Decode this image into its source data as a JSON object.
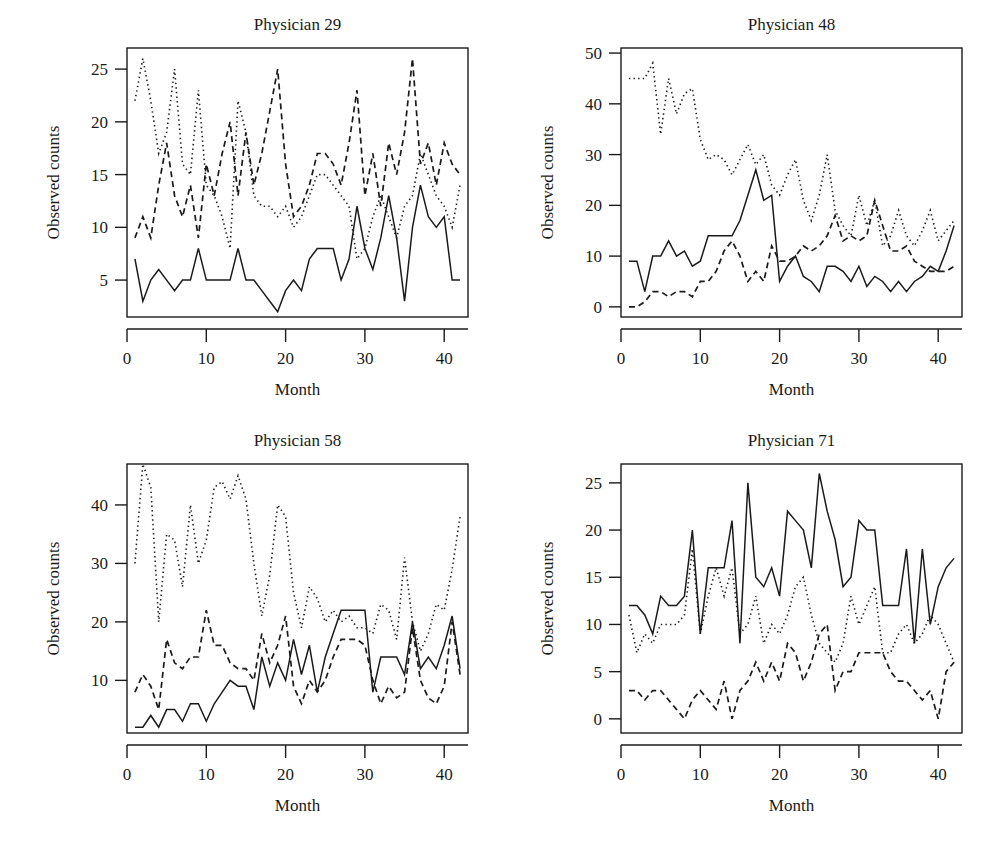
{
  "figure": {
    "background_color": "#ffffff",
    "line_color": "#1a1a1a",
    "panel_count": 4,
    "shared_xlabel": "Month",
    "shared_ylabel": "Observed counts"
  },
  "chart_data": [
    {
      "type": "line",
      "title": "Physician 29",
      "xlabel": "Month",
      "ylabel": "Observed counts",
      "xlim": [
        0,
        43
      ],
      "ylim": [
        1.5,
        27
      ],
      "xticks": [
        0,
        10,
        20,
        30,
        40
      ],
      "yticks": [
        5,
        10,
        15,
        20,
        25
      ],
      "grid": false,
      "legend": "none",
      "x": [
        1,
        2,
        3,
        4,
        5,
        6,
        7,
        8,
        9,
        10,
        11,
        12,
        13,
        14,
        15,
        16,
        17,
        18,
        19,
        20,
        21,
        22,
        23,
        24,
        25,
        26,
        27,
        28,
        29,
        30,
        31,
        32,
        33,
        34,
        35,
        36,
        37,
        38,
        39,
        40,
        41,
        42
      ],
      "series": [
        {
          "name": "observed",
          "style": "solid",
          "values": [
            7,
            3,
            5,
            6,
            5,
            4,
            5,
            5,
            8,
            5,
            5,
            5,
            5,
            8,
            5,
            5,
            4,
            3,
            2,
            4,
            5,
            4,
            7,
            8,
            8,
            8,
            5,
            7,
            12,
            8,
            6,
            9,
            13,
            9,
            3,
            10,
            14,
            11,
            10,
            11,
            5,
            5
          ]
        },
        {
          "name": "series-dashed",
          "style": "dashed",
          "values": [
            9,
            11,
            9,
            14,
            18,
            13,
            11,
            14,
            9,
            16,
            13,
            17,
            20,
            13,
            19,
            14,
            17,
            21,
            25,
            16,
            11,
            12,
            14,
            17,
            17,
            16,
            14,
            18,
            23,
            13,
            17,
            12,
            18,
            15,
            19,
            26,
            16,
            18,
            14,
            18,
            16,
            15
          ]
        },
        {
          "name": "series-dotted",
          "style": "dotted",
          "values": [
            22,
            26,
            22,
            17,
            19,
            25,
            16,
            15,
            23,
            14,
            13,
            11,
            8,
            22,
            19,
            13,
            12,
            12,
            11,
            12,
            10,
            11,
            13,
            15,
            15,
            14,
            13,
            12,
            7,
            8,
            11,
            13,
            11,
            9,
            12,
            13,
            17,
            15,
            13,
            12,
            10,
            14
          ]
        }
      ]
    },
    {
      "type": "line",
      "title": "Physician 48",
      "xlabel": "Month",
      "ylabel": "Observed counts",
      "xlim": [
        0,
        43
      ],
      "ylim": [
        -2,
        51
      ],
      "xticks": [
        0,
        10,
        20,
        30,
        40
      ],
      "yticks": [
        0,
        10,
        20,
        30,
        40,
        50
      ],
      "grid": false,
      "legend": "none",
      "x": [
        1,
        2,
        3,
        4,
        5,
        6,
        7,
        8,
        9,
        10,
        11,
        12,
        13,
        14,
        15,
        16,
        17,
        18,
        19,
        20,
        21,
        22,
        23,
        24,
        25,
        26,
        27,
        28,
        29,
        30,
        31,
        32,
        33,
        34,
        35,
        36,
        37,
        38,
        39,
        40,
        41,
        42
      ],
      "series": [
        {
          "name": "observed",
          "style": "solid",
          "values": [
            9,
            9,
            3,
            10,
            10,
            13,
            10,
            11,
            8,
            9,
            14,
            14,
            14,
            14,
            17,
            22,
            27,
            21,
            22,
            5,
            8,
            10,
            6,
            5,
            3,
            8,
            8,
            7,
            5,
            8,
            4,
            6,
            5,
            3,
            5,
            3,
            5,
            6,
            8,
            7,
            11,
            16
          ]
        },
        {
          "name": "series-dashed",
          "style": "dashed",
          "values": [
            0,
            0,
            1,
            3,
            3,
            2,
            3,
            3,
            2,
            5,
            5,
            7,
            11,
            13,
            10,
            5,
            7,
            5,
            12,
            9,
            9,
            10,
            12,
            11,
            12,
            14,
            18,
            13,
            14,
            13,
            14,
            21,
            16,
            11,
            11,
            12,
            9,
            8,
            7,
            7,
            7,
            8
          ]
        },
        {
          "name": "series-dotted",
          "style": "dotted",
          "values": [
            45,
            45,
            45,
            48,
            34,
            45,
            38,
            42,
            43,
            33,
            29,
            30,
            29,
            26,
            29,
            32,
            28,
            30,
            24,
            22,
            26,
            29,
            21,
            17,
            22,
            30,
            19,
            16,
            14,
            22,
            16,
            21,
            12,
            14,
            19,
            14,
            12,
            15,
            19,
            13,
            15,
            17
          ]
        }
      ]
    },
    {
      "type": "line",
      "title": "Physician 58",
      "xlabel": "Month",
      "ylabel": "Observed counts",
      "xlim": [
        0,
        43
      ],
      "ylim": [
        1,
        47
      ],
      "xticks": [
        0,
        10,
        20,
        30,
        40
      ],
      "yticks": [
        10,
        20,
        30,
        40
      ],
      "grid": false,
      "legend": "none",
      "x": [
        1,
        2,
        3,
        4,
        5,
        6,
        7,
        8,
        9,
        10,
        11,
        12,
        13,
        14,
        15,
        16,
        17,
        18,
        19,
        20,
        21,
        22,
        23,
        24,
        25,
        26,
        27,
        28,
        29,
        30,
        31,
        32,
        33,
        34,
        35,
        36,
        37,
        38,
        39,
        40,
        41,
        42
      ],
      "series": [
        {
          "name": "observed",
          "style": "solid",
          "values": [
            2,
            2,
            4,
            2,
            5,
            5,
            3,
            6,
            6,
            3,
            6,
            8,
            10,
            9,
            9,
            5,
            14,
            9,
            13,
            10,
            17,
            11,
            16,
            8,
            14,
            18,
            22,
            22,
            22,
            22,
            8,
            14,
            14,
            14,
            11,
            20,
            12,
            14,
            12,
            16,
            21,
            12
          ]
        },
        {
          "name": "series-dashed",
          "style": "dashed",
          "values": [
            8,
            11,
            9,
            5,
            17,
            13,
            12,
            14,
            14,
            22,
            16,
            16,
            13,
            12,
            12,
            10,
            18,
            13,
            16,
            21,
            9,
            6,
            10,
            8,
            10,
            14,
            17,
            17,
            17,
            16,
            10,
            6,
            9,
            7,
            8,
            19,
            10,
            7,
            6,
            9,
            20,
            11
          ]
        },
        {
          "name": "series-dotted",
          "style": "dotted",
          "values": [
            30,
            47,
            43,
            20,
            35,
            34,
            26,
            40,
            30,
            34,
            43,
            44,
            41,
            45,
            41,
            30,
            21,
            28,
            40,
            38,
            25,
            19,
            26,
            24,
            20,
            22,
            20,
            21,
            19,
            19,
            18,
            23,
            22,
            17,
            31,
            20,
            15,
            18,
            23,
            22,
            29,
            38
          ]
        }
      ]
    },
    {
      "type": "line",
      "title": "Physician 71",
      "xlabel": "Month",
      "ylabel": "Observed counts",
      "xlim": [
        0,
        43
      ],
      "ylim": [
        -1.5,
        27
      ],
      "xticks": [
        0,
        10,
        20,
        30,
        40
      ],
      "yticks": [
        0,
        5,
        10,
        15,
        20,
        25
      ],
      "grid": false,
      "legend": "none",
      "x": [
        1,
        2,
        3,
        4,
        5,
        6,
        7,
        8,
        9,
        10,
        11,
        12,
        13,
        14,
        15,
        16,
        17,
        18,
        19,
        20,
        21,
        22,
        23,
        24,
        25,
        26,
        27,
        28,
        29,
        30,
        31,
        32,
        33,
        34,
        35,
        36,
        37,
        38,
        39,
        40,
        41,
        42
      ],
      "series": [
        {
          "name": "observed",
          "style": "solid",
          "values": [
            12,
            12,
            11,
            9,
            13,
            12,
            12,
            13,
            20,
            9,
            16,
            16,
            16,
            21,
            8,
            25,
            15,
            14,
            16,
            13,
            22,
            21,
            20,
            16,
            26,
            22,
            19,
            14,
            15,
            21,
            20,
            20,
            12,
            12,
            12,
            18,
            8,
            18,
            10,
            14,
            16,
            17
          ]
        },
        {
          "name": "series-dashed",
          "style": "dashed",
          "values": [
            3,
            3,
            2,
            3,
            3,
            2,
            1,
            0,
            2,
            3,
            2,
            1,
            4,
            0,
            3,
            4,
            6,
            4,
            6,
            4,
            8,
            7,
            4,
            6,
            9,
            10,
            3,
            5,
            5,
            7,
            7,
            7,
            7,
            5,
            4,
            4,
            3,
            2,
            3,
            0,
            5,
            6
          ]
        },
        {
          "name": "series-dotted",
          "style": "dotted",
          "values": [
            11,
            7,
            9,
            8,
            10,
            10,
            10,
            11,
            18,
            9,
            13,
            16,
            13,
            16,
            9,
            10,
            13,
            8,
            10,
            9,
            11,
            14,
            15,
            11,
            8,
            7,
            6,
            8,
            13,
            10,
            12,
            14,
            7,
            7,
            9,
            10,
            8,
            9,
            11,
            10,
            8,
            6
          ]
        }
      ]
    }
  ]
}
